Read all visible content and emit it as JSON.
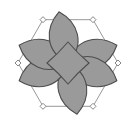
{
  "figure": {
    "title": "six-petal rosette geometric motif",
    "canvas": {
      "width": 136,
      "height": 126,
      "background": "#ffffff"
    },
    "colors": {
      "petal_fill": "#9a9a9a",
      "petal_stroke": "#4d4d4d",
      "center_fill": "#9a9a9a",
      "center_stroke": "#4d4d4d",
      "link_line": "#8c8c8c",
      "node_fill": "#ffffff",
      "node_stroke": "#7a7a7a",
      "background": "#ffffff"
    },
    "geometry": {
      "center_x": 68,
      "center_y": 63,
      "petal_count": 6,
      "petal_length": 52,
      "petal_width": 27,
      "petal_ring_radius": 33,
      "node_count": 6,
      "node_size": 6,
      "node_ring_radius": 50,
      "center_radius": 21,
      "petal_angles_deg": [
        70,
        110,
        170,
        250,
        290,
        350
      ],
      "node_angles_deg": [
        30,
        90,
        150,
        210,
        270,
        330
      ]
    },
    "elements": {
      "petal_label": "petal",
      "node_label": "vertex node",
      "link_label": "connector line",
      "core_label": "central concave diamond"
    }
  }
}
